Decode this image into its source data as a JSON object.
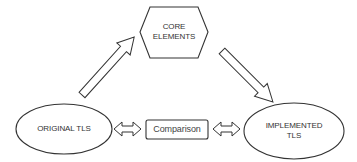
{
  "diagram": {
    "nodes": {
      "core": {
        "line1": "CORE",
        "line2": "ELEMENTS",
        "shape": "hexagon"
      },
      "original": {
        "label": "ORIGINAL TLS",
        "shape": "ellipse"
      },
      "implemented": {
        "line1": "IMPLEMENTED",
        "line2": "TLS",
        "shape": "ellipse"
      },
      "comparison": {
        "label": "Comparison",
        "shape": "rounded-rectangle"
      }
    },
    "edges": [
      {
        "from": "original",
        "to": "core",
        "type": "block-arrow"
      },
      {
        "from": "core",
        "to": "implemented",
        "type": "block-arrow"
      },
      {
        "from": "original",
        "to": "comparison",
        "type": "double-arrow"
      },
      {
        "from": "comparison",
        "to": "implemented",
        "type": "double-arrow"
      }
    ],
    "colors": {
      "stroke": "#333333",
      "fill": "#ffffff",
      "text": "#333333"
    }
  }
}
